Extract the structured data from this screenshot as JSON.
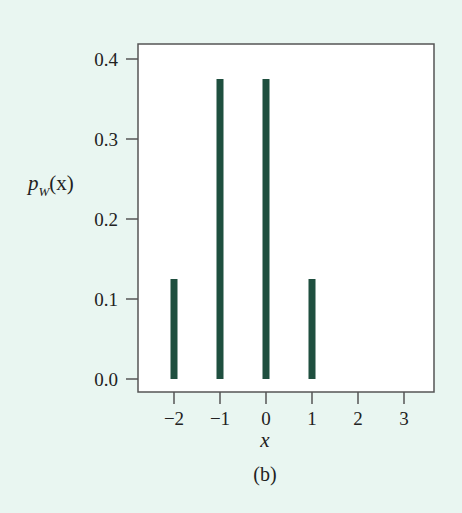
{
  "chart_data": {
    "type": "bar",
    "title": "",
    "caption": "(b)",
    "xlabel": "x",
    "ylabel": "p_W(x)",
    "ylabel_main": "p",
    "ylabel_sub": "W",
    "ylabel_arg": "(x)",
    "x": [
      -2,
      -1,
      0,
      1
    ],
    "categories": [
      "-2",
      "-1",
      "0",
      "1"
    ],
    "values": [
      0.125,
      0.375,
      0.375,
      0.125
    ],
    "xlim": [
      -2.8,
      3.6
    ],
    "ylim": [
      0.0,
      0.4
    ],
    "xticks": [
      -2,
      -1,
      0,
      1,
      2,
      3
    ],
    "xtick_labels": [
      "−2",
      "−1",
      "0",
      "1",
      "2",
      "3"
    ],
    "yticks": [
      0.0,
      0.1,
      0.2,
      0.3,
      0.4
    ],
    "ytick_labels": [
      "0.0",
      "0.1",
      "0.2",
      "0.3",
      "0.4"
    ],
    "grid": false,
    "legend": null,
    "colors": {
      "bar": "#1f4f3f",
      "frame": "#555555",
      "plot_background": "#ffffff",
      "page_background": "#e9f6f1"
    }
  }
}
